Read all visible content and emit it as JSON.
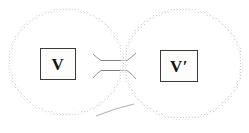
{
  "figure": {
    "style": "engraving-stipple",
    "background_color": "#ffffff",
    "ink_color": "#222222",
    "width": 249,
    "height": 133
  },
  "labels": {
    "left": {
      "text": "V",
      "box_fill": "#fdfdfb",
      "box_border": "#3a3a38"
    },
    "right": {
      "text": "V′",
      "box_fill": "#fdfdfb",
      "box_border": "#3a3a38"
    }
  },
  "shapes": {
    "left_sphere": {
      "name": "left-sphere",
      "cx": 66,
      "cy": 62,
      "rx": 58,
      "ry": 54
    },
    "right_sphere": {
      "name": "right-sphere",
      "cx": 183,
      "cy": 64,
      "rx": 60,
      "ry": 56
    },
    "connecting_tube": {
      "name": "connecting-tube",
      "x": 101,
      "y": 61,
      "width": 26,
      "height": 9
    },
    "left_shadow": {
      "name": "left-ground-shadow",
      "cx": 90,
      "cy": 113,
      "rx": 42,
      "ry": 9
    },
    "right_shadow": {
      "name": "right-ground-shadow",
      "cx": 216,
      "cy": 108,
      "rx": 33,
      "ry": 15
    }
  }
}
